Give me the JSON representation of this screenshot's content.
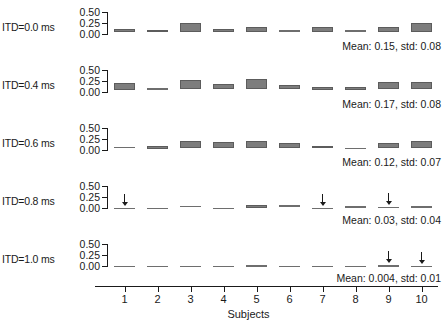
{
  "chart_data": {
    "type": "bar",
    "title": "",
    "subtitle": "",
    "xlabel": "Subjects",
    "ylabel": "",
    "categories": [
      "1",
      "2",
      "3",
      "4",
      "5",
      "6",
      "7",
      "8",
      "9",
      "10"
    ],
    "ylim": [
      0.0,
      0.5
    ],
    "yticks": [
      0.0,
      0.25,
      0.5
    ],
    "ytick_labels": [
      "0.00",
      "0.25",
      "0.50"
    ],
    "grid": false,
    "legend": null,
    "bar_style": "floating box (interval) per subject",
    "panels": [
      {
        "row_label": "ITD=0.0 ms",
        "itd_ms": 0.0,
        "stat_text": "Mean: 0.15, std: 0.08",
        "mean": 0.15,
        "std": 0.08,
        "bars": [
          {
            "subject": "1",
            "low": 0.045,
            "high": 0.115
          },
          {
            "subject": "2",
            "low": 0.04,
            "high": 0.1
          },
          {
            "subject": "3",
            "low": 0.05,
            "high": 0.255
          },
          {
            "subject": "4",
            "low": 0.045,
            "high": 0.115
          },
          {
            "subject": "5",
            "low": 0.04,
            "high": 0.15
          },
          {
            "subject": "6",
            "low": 0.04,
            "high": 0.09
          },
          {
            "subject": "7",
            "low": 0.05,
            "high": 0.16
          },
          {
            "subject": "8",
            "low": 0.04,
            "high": 0.08
          },
          {
            "subject": "9",
            "low": 0.05,
            "high": 0.15
          },
          {
            "subject": "10",
            "low": 0.055,
            "high": 0.25
          }
        ],
        "arrows": []
      },
      {
        "row_label": "ITD=0.4 ms",
        "itd_ms": 0.4,
        "stat_text": "Mean: 0.17, std: 0.08",
        "mean": 0.17,
        "std": 0.08,
        "bars": [
          {
            "subject": "1",
            "low": 0.055,
            "high": 0.195
          },
          {
            "subject": "2",
            "low": 0.04,
            "high": 0.08
          },
          {
            "subject": "3",
            "low": 0.06,
            "high": 0.265
          },
          {
            "subject": "4",
            "low": 0.06,
            "high": 0.175
          },
          {
            "subject": "5",
            "low": 0.065,
            "high": 0.285
          },
          {
            "subject": "6",
            "low": 0.06,
            "high": 0.16
          },
          {
            "subject": "7",
            "low": 0.05,
            "high": 0.105
          },
          {
            "subject": "8",
            "low": 0.05,
            "high": 0.125
          },
          {
            "subject": "9",
            "low": 0.06,
            "high": 0.235
          },
          {
            "subject": "10",
            "low": 0.065,
            "high": 0.235
          }
        ],
        "arrows": []
      },
      {
        "row_label": "ITD=0.6 ms",
        "itd_ms": 0.6,
        "stat_text": "Mean: 0.12, std: 0.07",
        "mean": 0.12,
        "std": 0.07,
        "bars": [
          {
            "subject": "1",
            "low": 0.03,
            "high": 0.075
          },
          {
            "subject": "2",
            "low": 0.03,
            "high": 0.085
          },
          {
            "subject": "3",
            "low": 0.045,
            "high": 0.2
          },
          {
            "subject": "4",
            "low": 0.045,
            "high": 0.185
          },
          {
            "subject": "5",
            "low": 0.045,
            "high": 0.21
          },
          {
            "subject": "6",
            "low": 0.045,
            "high": 0.155
          },
          {
            "subject": "7",
            "low": 0.035,
            "high": 0.085
          },
          {
            "subject": "8",
            "low": 0.03,
            "high": 0.055
          },
          {
            "subject": "9",
            "low": 0.045,
            "high": 0.16
          },
          {
            "subject": "10",
            "low": 0.05,
            "high": 0.215
          }
        ],
        "arrows": []
      },
      {
        "row_label": "ITD=0.8 ms",
        "itd_ms": 0.8,
        "stat_text": "Mean: 0.03, std: 0.04",
        "mean": 0.03,
        "std": 0.04,
        "bars": [
          {
            "subject": "1",
            "low": 0.0,
            "high": 0.008
          },
          {
            "subject": "2",
            "low": 0.0,
            "high": 0.008
          },
          {
            "subject": "3",
            "low": 0.01,
            "high": 0.055
          },
          {
            "subject": "4",
            "low": 0.0,
            "high": 0.008
          },
          {
            "subject": "5",
            "low": 0.01,
            "high": 0.065
          },
          {
            "subject": "6",
            "low": 0.01,
            "high": 0.06
          },
          {
            "subject": "7",
            "low": 0.0,
            "high": 0.008
          },
          {
            "subject": "8",
            "low": 0.01,
            "high": 0.045
          },
          {
            "subject": "9",
            "low": 0.008,
            "high": 0.03
          },
          {
            "subject": "10",
            "low": 0.01,
            "high": 0.042
          }
        ],
        "arrows": [
          "1",
          "7",
          "9"
        ]
      },
      {
        "row_label": "ITD=1.0 ms",
        "itd_ms": 1.0,
        "stat_text": "Mean: 0.004, std: 0.01",
        "mean": 0.004,
        "std": 0.01,
        "bars": [
          {
            "subject": "1",
            "low": 0.0,
            "high": 0.006
          },
          {
            "subject": "2",
            "low": 0.0,
            "high": 0.006
          },
          {
            "subject": "3",
            "low": 0.0,
            "high": 0.006
          },
          {
            "subject": "4",
            "low": 0.0,
            "high": 0.006
          },
          {
            "subject": "5",
            "low": 0.0,
            "high": 0.022
          },
          {
            "subject": "6",
            "low": 0.0,
            "high": 0.006
          },
          {
            "subject": "7",
            "low": 0.0,
            "high": 0.006
          },
          {
            "subject": "8",
            "low": 0.0,
            "high": 0.006
          },
          {
            "subject": "9",
            "low": 0.0,
            "high": 0.018
          },
          {
            "subject": "10",
            "low": 0.0,
            "high": 0.01
          }
        ],
        "arrows": [
          "9",
          "10"
        ]
      }
    ],
    "colors": {
      "bar_fill": "#7d7d7d",
      "bar_edge": "#5c5c5c",
      "axis": "#1a1a1a",
      "background": "#ffffff"
    }
  }
}
